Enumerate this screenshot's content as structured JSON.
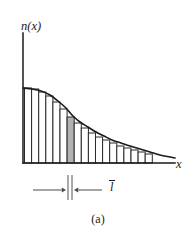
{
  "figure": {
    "caption": "(a)",
    "axes": {
      "y_label": "n(x)",
      "x_label": "x",
      "origin_px": [
        23,
        163
      ],
      "x_axis_end_px": [
        175,
        163
      ],
      "y_axis_top_px": [
        23,
        33
      ]
    },
    "annotation": {
      "dimension_label": "l",
      "dimension_label_has_overbar": true,
      "meaning": "mean free path",
      "left_arrow_from_px": [
        33,
        190
      ],
      "left_arrow_to_px": [
        66,
        190
      ],
      "right_arrow_from_px": [
        102,
        190
      ],
      "right_arrow_to_px": [
        74,
        190
      ],
      "leader_left_x_px": 68,
      "leader_right_x_px": 72,
      "leader_top_px": 175,
      "leader_bottom_px": 200
    },
    "colors": {
      "curve": "#1a1a1a",
      "axis": "#1a1a1a",
      "bar_stroke": "#2b2b2b",
      "bar_fill": "#ffffff",
      "highlight_fill": "#b3b3b3",
      "background": "#ffffff",
      "annotation": "#555555"
    }
  },
  "chart_data": {
    "type": "bar",
    "title": "",
    "xlabel": "x",
    "ylabel": "n(x)",
    "grid": false,
    "legend": false,
    "baseline_y": 163,
    "bar_width_px": 7.1,
    "highlighted_index": 6,
    "curve_points_px": [
      [
        23,
        88
      ],
      [
        32,
        89
      ],
      [
        41,
        91
      ],
      [
        50,
        95
      ],
      [
        58,
        101
      ],
      [
        66,
        108
      ],
      [
        73,
        116
      ],
      [
        80,
        122
      ],
      [
        88,
        127
      ],
      [
        96,
        132
      ],
      [
        104,
        136
      ],
      [
        112,
        140
      ],
      [
        121,
        143
      ],
      [
        130,
        146
      ],
      [
        140,
        149
      ],
      [
        150,
        152
      ],
      [
        160,
        155
      ],
      [
        170,
        157
      ],
      [
        175,
        158
      ]
    ],
    "categories": [
      "x1",
      "x2",
      "x3",
      "x4",
      "x5",
      "x6",
      "x7",
      "x8",
      "x9",
      "x10",
      "x11",
      "x12",
      "x13",
      "x14",
      "x15",
      "x16",
      "x17",
      "x18"
    ],
    "bar_left_px": [
      24.5,
      31.6,
      38.7,
      45.8,
      52.9,
      60.0,
      67.1,
      74.2,
      81.3,
      88.4,
      95.5,
      102.6,
      109.7,
      116.8,
      123.9,
      131.0,
      138.1,
      145.2
    ],
    "bar_top_px": [
      88,
      89,
      92,
      96,
      102,
      109,
      117,
      123,
      128,
      133,
      137,
      140,
      143,
      146,
      148,
      150,
      152,
      154
    ],
    "values": [
      75,
      74,
      71,
      67,
      61,
      54,
      46,
      40,
      35,
      30,
      26,
      23,
      20,
      17,
      15,
      13,
      11,
      9
    ],
    "ylim": [
      0,
      90
    ],
    "xlim": [
      0,
      152
    ]
  }
}
